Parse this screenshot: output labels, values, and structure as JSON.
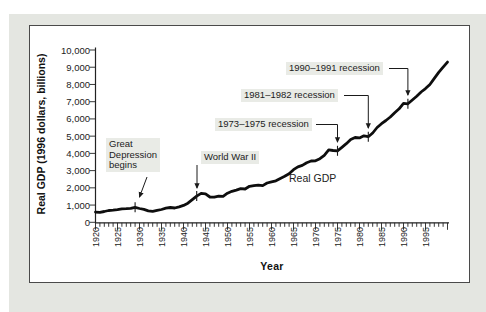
{
  "axis": {
    "y_title": "Real GDP (1996 dollars, billions)",
    "x_title": "Year"
  },
  "labels": {
    "great_depression": "Great\nDepression\nbegins",
    "world_war_ii": "World War II",
    "recession_73_75": "1973–1975 recession",
    "recession_81_82": "1981–1982 recession",
    "recession_90_91": "1990–1991 recession",
    "curve": "Real GDP"
  },
  "colors": {
    "curve": "#0e0e0e",
    "card_background": "#e4e6e1",
    "plot_background": "#ffffff",
    "annotation_background": "#e9ebe6",
    "text": "#1a1a1a"
  },
  "chart_data": {
    "type": "line",
    "title": "",
    "xlabel": "Year",
    "ylabel": "Real GDP (1996 dollars, billions)",
    "xlim": [
      1920,
      2001
    ],
    "ylim": [
      0,
      10000
    ],
    "grid": false,
    "legend": "none",
    "x_tick_labels": [
      "1920",
      "1925",
      "1930",
      "1935",
      "1940",
      "1945",
      "1950",
      "1955",
      "1960",
      "1965",
      "1970",
      "1975",
      "1980",
      "1985",
      "1990",
      "1995"
    ],
    "y_tick_labels": [
      "0",
      "1,000",
      "2,000",
      "3,000",
      "4,000",
      "5,000",
      "6,000",
      "7,000",
      "8,000",
      "9,000",
      "10,000"
    ],
    "x_minor_tick_step_years": 1,
    "series": [
      {
        "name": "Real GDP",
        "x": [
          1920,
          1921,
          1922,
          1923,
          1924,
          1925,
          1926,
          1927,
          1928,
          1929,
          1930,
          1931,
          1932,
          1933,
          1934,
          1935,
          1936,
          1937,
          1938,
          1939,
          1940,
          1941,
          1942,
          1943,
          1944,
          1945,
          1946,
          1947,
          1948,
          1949,
          1950,
          1951,
          1952,
          1953,
          1954,
          1955,
          1956,
          1957,
          1958,
          1959,
          1960,
          1961,
          1962,
          1963,
          1964,
          1965,
          1966,
          1967,
          1968,
          1969,
          1970,
          1971,
          1972,
          1973,
          1974,
          1975,
          1976,
          1977,
          1978,
          1979,
          1980,
          1981,
          1982,
          1983,
          1984,
          1985,
          1986,
          1987,
          1988,
          1989,
          1990,
          1991,
          1992,
          1993,
          1994,
          1995,
          1996,
          1997,
          1998,
          1999,
          2000
        ],
        "values": [
          590,
          580,
          625,
          685,
          705,
          735,
          785,
          795,
          815,
          870,
          800,
          750,
          665,
          640,
          690,
          745,
          820,
          860,
          830,
          900,
          980,
          1110,
          1310,
          1520,
          1680,
          1650,
          1470,
          1460,
          1520,
          1510,
          1690,
          1800,
          1870,
          1950,
          1930,
          2090,
          2130,
          2160,
          2130,
          2280,
          2350,
          2410,
          2550,
          2670,
          2820,
          3050,
          3220,
          3300,
          3460,
          3560,
          3570,
          3690,
          3890,
          4200,
          4170,
          4150,
          4350,
          4560,
          4800,
          4920,
          4900,
          5020,
          4970,
          5180,
          5500,
          5720,
          5910,
          6110,
          6360,
          6590,
          6900,
          6880,
          7100,
          7320,
          7560,
          7760,
          8000,
          8350,
          8700,
          9000,
          9300
        ]
      }
    ],
    "annotations": [
      {
        "text": "Great Depression begins",
        "target_year": 1929
      },
      {
        "text": "World War II",
        "target_year": 1943
      },
      {
        "text": "1973–1975 recession",
        "target_year": 1975
      },
      {
        "text": "1981–1982 recession",
        "target_year": 1982
      },
      {
        "text": "1990–1991 recession",
        "target_year": 1991
      }
    ]
  }
}
